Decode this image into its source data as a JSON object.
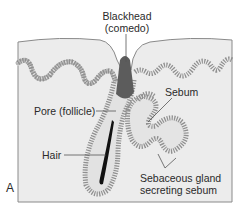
{
  "figure": {
    "panel_label": "A",
    "labels": {
      "blackhead_line1": "Blackhead",
      "blackhead_line2": "(comedo)",
      "sebum": "Sebum",
      "pore": "Pore (follicle)",
      "hair": "Hair",
      "gland_line1": "Sebaceous gland",
      "gland_line2": "secreting sebum"
    },
    "colors": {
      "tissue": "#ececec",
      "border": "#8a8a8a",
      "cell_layer": "#9a9a9a",
      "blackhead": "#5c5c5c",
      "hair": "#111111",
      "leader_line": "#555555"
    }
  }
}
